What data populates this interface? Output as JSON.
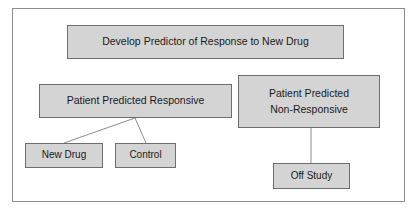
{
  "diagram": {
    "title_node": {
      "label": "Develop Predictor of Response to New Drug"
    },
    "branch_responsive": {
      "label": "Patient Predicted Responsive"
    },
    "branch_nonresponsive": {
      "line1": "Patient Predicted",
      "line2": "Non-Responsive"
    },
    "arm_new_drug": {
      "label": "New Drug"
    },
    "arm_control": {
      "label": "Control"
    },
    "outcome_off_study": {
      "label": "Off Study"
    }
  },
  "style": {
    "box_fill": "#d4d4d4",
    "box_border": "#6e6e6e",
    "frame_border": "#8c8c8c",
    "connector_color": "#8c8c8c",
    "background": "#ffffff",
    "text_color": "#1a1a1a"
  }
}
